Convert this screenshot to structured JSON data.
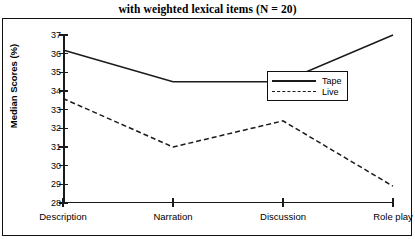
{
  "title": "with weighted lexical items (N = 20)",
  "legend": {
    "position": "upper-right-inside",
    "items": [
      {
        "label": "Tape",
        "style": "solid"
      },
      {
        "label": "Live",
        "style": "dashed"
      }
    ]
  },
  "chart_data": {
    "type": "line",
    "title": "with weighted lexical items (N = 20)",
    "xlabel": "",
    "ylabel": "Median Scores (%)",
    "categories": [
      "Description",
      "Narration",
      "Discussion",
      "Role play"
    ],
    "ylim": [
      28,
      37
    ],
    "yticks": [
      28,
      29,
      30,
      31,
      32,
      33,
      34,
      35,
      36,
      37
    ],
    "grid": false,
    "series": [
      {
        "name": "Tape",
        "style": "solid",
        "values": [
          36.2,
          34.5,
          34.5,
          37.0
        ]
      },
      {
        "name": "Live",
        "style": "dashed",
        "values": [
          33.6,
          31.0,
          32.4,
          28.9
        ]
      }
    ]
  }
}
